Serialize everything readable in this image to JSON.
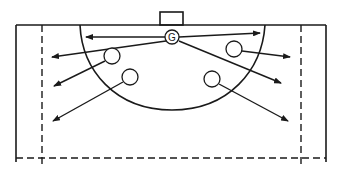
{
  "diagram": {
    "type": "handball-court-goalkeeper-distribution",
    "stroke_color": "#1a1a1a",
    "background": "#ffffff",
    "goalkeeper": {
      "label": "G",
      "cx": 172,
      "cy": 37,
      "r": 7
    },
    "players": [
      {
        "id": "left-upper",
        "cx": 112,
        "cy": 56,
        "r": 8
      },
      {
        "id": "left-lower",
        "cx": 130,
        "cy": 77,
        "r": 8
      },
      {
        "id": "right-upper",
        "cx": 234,
        "cy": 49,
        "r": 8
      },
      {
        "id": "right-lower",
        "cx": 212,
        "cy": 79,
        "r": 8
      }
    ],
    "passes": [
      {
        "from": "G",
        "x1": 165,
        "y1": 37,
        "x2": 86,
        "y2": 37
      },
      {
        "from": "G",
        "x1": 179,
        "y1": 37,
        "x2": 260,
        "y2": 33
      },
      {
        "from": "G",
        "x1": 166,
        "y1": 41,
        "x2": 52,
        "y2": 57
      },
      {
        "from": "G",
        "x1": 179,
        "y1": 41,
        "x2": 281,
        "y2": 83
      },
      {
        "from": "left-upper",
        "x1": 105,
        "y1": 61,
        "x2": 54,
        "y2": 86
      },
      {
        "from": "left-lower",
        "x1": 123,
        "y1": 82,
        "x2": 53,
        "y2": 121
      },
      {
        "from": "right-upper",
        "x1": 242,
        "y1": 51,
        "x2": 290,
        "y2": 57
      },
      {
        "from": "right-lower",
        "x1": 219,
        "y1": 84,
        "x2": 288,
        "y2": 121
      }
    ]
  }
}
